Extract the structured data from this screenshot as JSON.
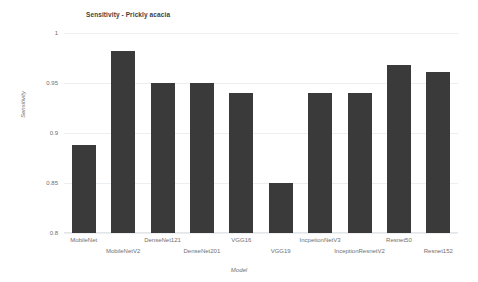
{
  "chart_data": {
    "type": "bar",
    "title": "Sensitivity - Prickly acacia",
    "xlabel": "Model",
    "ylabel": "Sensitivity",
    "ylim": [
      0.8,
      1.0
    ],
    "yticks": [
      "1",
      "0.95",
      "0.9",
      "0.85",
      "0.8"
    ],
    "ytick_values": [
      1,
      0.95,
      0.9,
      0.85,
      0.8
    ],
    "grid": true,
    "legend": "none",
    "bar_color": "#3a3a3a",
    "categories": [
      "MobileNet",
      "MobileNetV2",
      "DenseNet121",
      "DenseNet201",
      "VGG16",
      "VGG19",
      "IncpetionNetV3",
      "InceptionResnetV2",
      "Resnet50",
      "Resnet152"
    ],
    "values": [
      0.888,
      0.982,
      0.95,
      0.95,
      0.94,
      0.85,
      0.94,
      0.94,
      0.968,
      0.961
    ],
    "series": [
      {
        "name": "Sensitivity",
        "values": [
          0.888,
          0.982,
          0.95,
          0.95,
          0.94,
          0.85,
          0.94,
          0.94,
          0.968,
          0.961
        ]
      }
    ]
  }
}
